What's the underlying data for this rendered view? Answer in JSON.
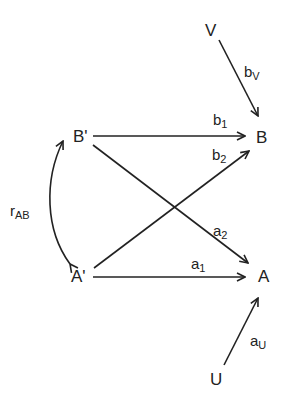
{
  "diagram": {
    "type": "path-diagram",
    "nodes": [
      {
        "id": "V",
        "label": "V"
      },
      {
        "id": "B_prime",
        "label": "B'"
      },
      {
        "id": "B",
        "label": "B"
      },
      {
        "id": "A_prime",
        "label": "A'"
      },
      {
        "id": "A",
        "label": "A"
      },
      {
        "id": "U",
        "label": "U"
      }
    ],
    "edges": [
      {
        "from": "V",
        "to": "B",
        "label_main": "b",
        "label_sub": "V"
      },
      {
        "from": "B_prime",
        "to": "B",
        "label_main": "b",
        "label_sub": "1"
      },
      {
        "from": "A_prime",
        "to": "B",
        "label_main": "b",
        "label_sub": "2"
      },
      {
        "from": "B_prime",
        "to": "A",
        "label_main": "a",
        "label_sub": "2"
      },
      {
        "from": "A_prime",
        "to": "A",
        "label_main": "a",
        "label_sub": "1"
      },
      {
        "from": "U",
        "to": "A",
        "label_main": "a",
        "label_sub": "U"
      },
      {
        "from": "A_prime",
        "to": "B_prime",
        "label_main": "r",
        "label_sub": "AB",
        "bidirectional": true
      }
    ]
  }
}
